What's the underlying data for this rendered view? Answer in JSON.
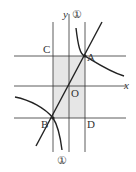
{
  "diagram": {
    "axis_labels": {
      "x": "x",
      "y": "y"
    },
    "points": {
      "A": "A",
      "B": "B",
      "C": "C",
      "D": "D",
      "O": "O"
    },
    "curve_label_top": "①",
    "curve_label_bottom": "①",
    "colors": {
      "line": "#333333",
      "shade": "#e6e6e6"
    }
  }
}
